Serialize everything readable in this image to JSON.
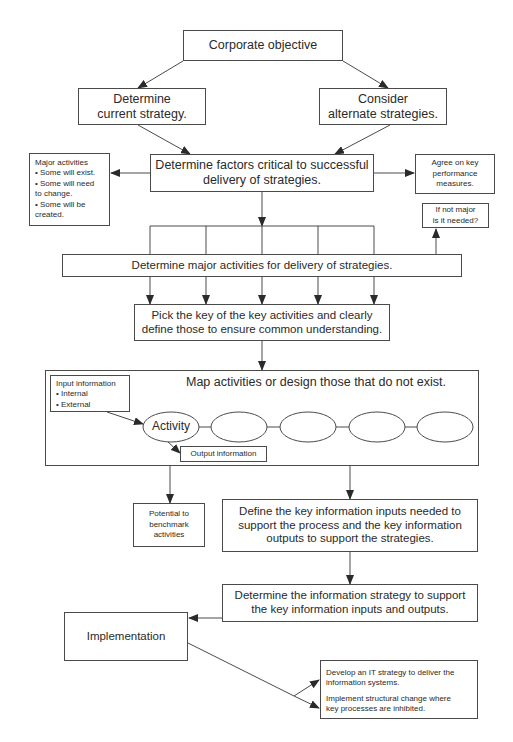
{
  "diagram": {
    "nodes": {
      "corporate_objective": "Corporate objective",
      "current_strategy": "Determine\ncurrent strategy.",
      "alternate_strategies": "Consider\nalternate strategies.",
      "critical_factors": "Determine factors critical to successful\ndelivery of strategies.",
      "major_activities_note": "Major activities\n• Some will exist.\n• Some will need\n  to change.\n• Some will be\n  created.",
      "performance_measures": "Agree on key\nperformance\nmeasures.",
      "if_not_major": "If not major\nis it needed?",
      "determine_major_activities": "Determine major activities for delivery of strategies.",
      "pick_key_activities": "Pick the key of the key activities and clearly\ndefine those to ensure common understanding.",
      "map_activities_title": "Map activities or design those that do not exist.",
      "input_information": "Input information\n• Internal\n• External",
      "activity": "Activity",
      "output_information": "Output information",
      "benchmark": "Potential to\nbenchmark\nactivities",
      "define_key_info": "Define the key information inputs needed to\nsupport the process and the key information\noutputs to support the strategies.",
      "info_strategy": "Determine the information strategy to support\nthe key information inputs and outputs.",
      "implementation": "Implementation",
      "it_strategy": "Develop an IT strategy to deliver the\ninformation systems.",
      "structural_change": "Implement structural change where\nkey processes are inhibited."
    },
    "colors": {
      "line": "#4a4a4a",
      "text": "#2a2a2a",
      "background": "#ffffff"
    }
  }
}
